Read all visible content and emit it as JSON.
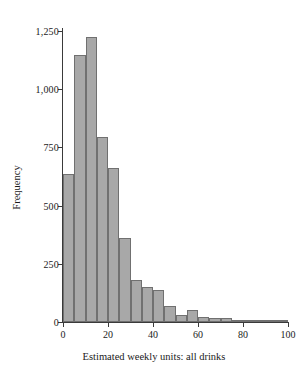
{
  "chart_data": {
    "type": "bar",
    "title": "",
    "xlabel": "Estimated weekly units: all drinks",
    "ylabel": "Frequency",
    "xlim": [
      0,
      100
    ],
    "ylim": [
      0,
      1250
    ],
    "grid": false,
    "legend": null,
    "bin_width": 5,
    "bar_color": "#a8a8a8",
    "bar_edge_color": "#707070",
    "axis_color": "#3a3a3a",
    "xticks": [
      0,
      20,
      40,
      60,
      80,
      100
    ],
    "xtick_labels": [
      "0",
      "20",
      "40",
      "60",
      "80",
      "100"
    ],
    "yticks": [
      0,
      250,
      500,
      750,
      1000,
      1250
    ],
    "ytick_labels": [
      "0",
      "250",
      "500",
      "750",
      "1,000",
      "1,250"
    ],
    "bins": [
      {
        "x0": 0,
        "x1": 5,
        "label": "0-5",
        "value": 635
      },
      {
        "x0": 5,
        "x1": 10,
        "label": "5-10",
        "value": 1145
      },
      {
        "x0": 10,
        "x1": 15,
        "label": "10-15",
        "value": 1225
      },
      {
        "x0": 15,
        "x1": 20,
        "label": "15-20",
        "value": 795
      },
      {
        "x0": 20,
        "x1": 25,
        "label": "20-25",
        "value": 660
      },
      {
        "x0": 25,
        "x1": 30,
        "label": "25-30",
        "value": 360
      },
      {
        "x0": 30,
        "x1": 35,
        "label": "30-35",
        "value": 180
      },
      {
        "x0": 35,
        "x1": 40,
        "label": "35-40",
        "value": 152
      },
      {
        "x0": 40,
        "x1": 45,
        "label": "40-45",
        "value": 137
      },
      {
        "x0": 45,
        "x1": 50,
        "label": "45-50",
        "value": 70
      },
      {
        "x0": 50,
        "x1": 55,
        "label": "50-55",
        "value": 30
      },
      {
        "x0": 55,
        "x1": 60,
        "label": "55-60",
        "value": 52
      },
      {
        "x0": 60,
        "x1": 65,
        "label": "60-65",
        "value": 22
      },
      {
        "x0": 65,
        "x1": 70,
        "label": "65-70",
        "value": 18
      },
      {
        "x0": 70,
        "x1": 75,
        "label": "70-75",
        "value": 16
      },
      {
        "x0": 75,
        "x1": 80,
        "label": "75-80",
        "value": 8
      },
      {
        "x0": 80,
        "x1": 85,
        "label": "80-85",
        "value": 6
      },
      {
        "x0": 85,
        "x1": 90,
        "label": "85-90",
        "value": 5
      },
      {
        "x0": 90,
        "x1": 95,
        "label": "90-95",
        "value": 10
      },
      {
        "x0": 95,
        "x1": 100,
        "label": "95-100",
        "value": 5
      }
    ]
  }
}
